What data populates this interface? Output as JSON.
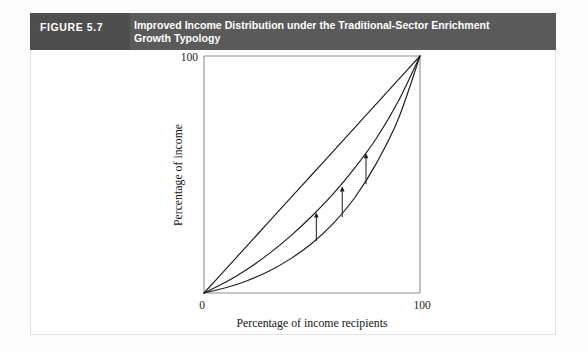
{
  "figure": {
    "number_label": "FIGURE 5.7",
    "title": "Improved Income Distribution under the Traditional-Sector Enrichment Growth Typology",
    "title_line1": "Improved Income Distribution under the Traditional-Sector Enrichment",
    "title_line2": "Growth Typology",
    "header_bg": "#5a5a5a",
    "header_number_bg": "#4e4e4e",
    "header_text_color": "#ffffff"
  },
  "chart_data": {
    "type": "line",
    "title": "Improved Income Distribution under the Traditional-Sector Enrichment Growth Typology",
    "xlabel": "Percentage of income recipients",
    "ylabel": "Percentage of income",
    "xlim": [
      0,
      100
    ],
    "ylim": [
      0,
      100
    ],
    "x_tick_labels": [
      "0",
      "100"
    ],
    "y_tick_labels": [
      "0",
      "100"
    ],
    "x_ticks": [
      0,
      100
    ],
    "y_ticks": [
      0,
      100
    ],
    "grid": false,
    "legend": "none",
    "line_color": "#1d1d1d",
    "axis_color": "#8d8d8d",
    "series": [
      {
        "name": "Line of equality",
        "x": [
          0,
          10,
          20,
          30,
          40,
          50,
          60,
          70,
          80,
          90,
          100
        ],
        "values": [
          0,
          10,
          20,
          30,
          40,
          50,
          60,
          70,
          80,
          90,
          100
        ]
      },
      {
        "name": "Lorenz curve after traditional-sector enrichment",
        "x": [
          0,
          10,
          20,
          30,
          40,
          50,
          60,
          70,
          80,
          90,
          100
        ],
        "values": [
          0,
          4.5,
          10,
          16.5,
          24,
          32.5,
          42,
          53,
          65.5,
          81,
          100
        ]
      },
      {
        "name": "Lorenz curve before (original distribution)",
        "x": [
          0,
          10,
          20,
          30,
          40,
          50,
          60,
          70,
          80,
          90,
          100
        ],
        "values": [
          0,
          2.2,
          5.2,
          9.2,
          14.4,
          21,
          29.5,
          40.5,
          55,
          73.5,
          100
        ]
      }
    ],
    "annotations": [
      {
        "type": "arrow",
        "label": "improvement-arrow-1",
        "x": 52,
        "y_from": 22,
        "y_to": 34,
        "direction": "up"
      },
      {
        "type": "arrow",
        "label": "improvement-arrow-2",
        "x": 64,
        "y_from": 32,
        "y_to": 45,
        "direction": "up"
      },
      {
        "type": "arrow",
        "label": "improvement-arrow-3",
        "x": 75,
        "y_from": 46,
        "y_to": 59,
        "direction": "up"
      }
    ]
  }
}
